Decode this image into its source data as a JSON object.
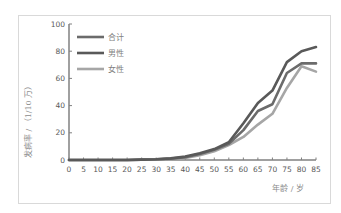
{
  "chart_data": {
    "type": "line",
    "title": "",
    "xlabel": "年龄 / 岁",
    "ylabel": "发病率 / （1/10 万）",
    "x": [
      0,
      5,
      10,
      15,
      20,
      25,
      30,
      35,
      40,
      45,
      50,
      55,
      60,
      65,
      70,
      75,
      80,
      85
    ],
    "xticks": [
      "0",
      "5",
      "10",
      "15",
      "20",
      "25",
      "30",
      "35",
      "40",
      "45",
      "50",
      "55",
      "60",
      "65",
      "70",
      "75",
      "80",
      "85"
    ],
    "yticks": [
      "0",
      "20",
      "40",
      "60",
      "80",
      "100"
    ],
    "ylim": [
      0,
      100
    ],
    "xlim": [
      0,
      85
    ],
    "grid": false,
    "legend_position": "top-left inside",
    "series": [
      {
        "name": "合计",
        "color": "#6b6b6b",
        "values": [
          0,
          0,
          0,
          0,
          0,
          0.3,
          0.5,
          1,
          2,
          4.5,
          7.5,
          12,
          22,
          36,
          41,
          64,
          71,
          71
        ]
      },
      {
        "name": "男性",
        "color": "#595959",
        "values": [
          0,
          0,
          0,
          0,
          0,
          0.3,
          0.5,
          1.2,
          2.5,
          5,
          8,
          13,
          27,
          42,
          51,
          72,
          80,
          83
        ]
      },
      {
        "name": "女性",
        "color": "#a6a6a6",
        "values": [
          0,
          0,
          0,
          0,
          0,
          0.2,
          0.4,
          0.8,
          1.5,
          3.5,
          6.5,
          11,
          17,
          26,
          34,
          53,
          69,
          65
        ]
      }
    ]
  },
  "legend": {
    "items": [
      {
        "label": "合计",
        "color": "#6b6b6b"
      },
      {
        "label": "男性",
        "color": "#595959"
      },
      {
        "label": "女性",
        "color": "#a6a6a6"
      }
    ]
  },
  "axes": {
    "x_title": "年龄 / 岁",
    "y_title": "发病率 / （1/10 万）"
  }
}
